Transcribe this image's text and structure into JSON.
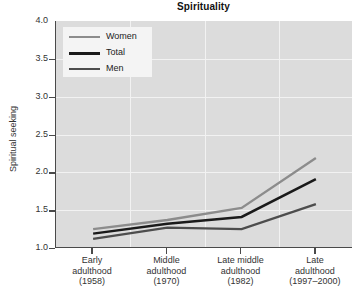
{
  "chart_data": {
    "type": "line",
    "title": "Spirituality",
    "xlabel": "",
    "ylabel": "Spiritual seeking",
    "ylim": [
      1.0,
      4.0
    ],
    "ytick_labels": [
      "4.0",
      "3.5",
      "3.0",
      "2.5",
      "2.0",
      "1.5",
      "1.0"
    ],
    "ytick_values": [
      4.0,
      3.5,
      3.0,
      2.5,
      2.0,
      1.5,
      1.0
    ],
    "grid": true,
    "legend_position": "upper left",
    "categories": [
      "Early adulthood (1958)",
      "Middle adulthood (1970)",
      "Late middle adulthood (1982)",
      "Late adulthood (1997-2000)"
    ],
    "category_lines": [
      [
        "Early",
        "adulthood",
        "(1958)"
      ],
      [
        "Middle",
        "adulthood",
        "(1970)"
      ],
      [
        "Late middle",
        "adulthood",
        "(1982)"
      ],
      [
        "Late",
        "adulthood",
        "(1997–2000)"
      ]
    ],
    "series": [
      {
        "name": "Women",
        "color": "#8c8c8c",
        "width": 2.3,
        "values": [
          1.25,
          1.37,
          1.53,
          2.19
        ]
      },
      {
        "name": "Total",
        "color": "#1a1a1a",
        "width": 2.5,
        "values": [
          1.19,
          1.32,
          1.41,
          1.91
        ]
      },
      {
        "name": "Men",
        "color": "#4d4d4d",
        "width": 2.3,
        "values": [
          1.12,
          1.27,
          1.25,
          1.58
        ]
      }
    ]
  },
  "legend": {
    "entries": [
      {
        "label": "Women"
      },
      {
        "label": "Total"
      },
      {
        "label": "Men"
      }
    ]
  },
  "colors": {
    "plot_background": "#dcdcdc",
    "gridline": "#f2f2f2",
    "axis": "#4a4a4a",
    "legend_background": "#f4f4f4",
    "page_background": "#ffffff"
  }
}
